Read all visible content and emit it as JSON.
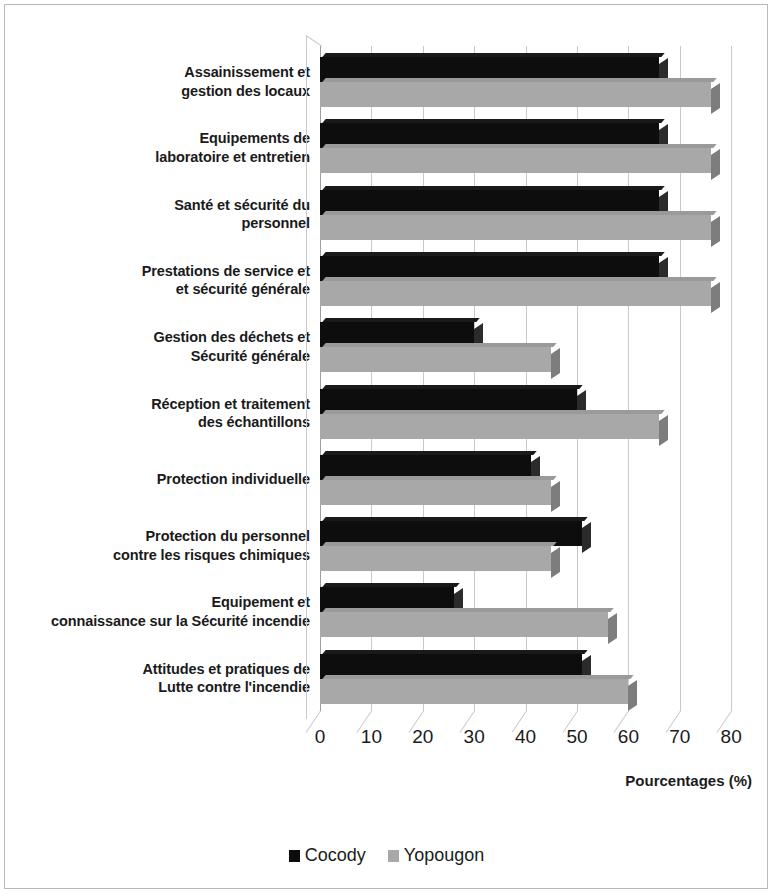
{
  "chart_data": {
    "type": "bar",
    "orientation": "horizontal",
    "title": "",
    "xlabel": "Pourcentages (%)",
    "ylabel": "",
    "xlim": [
      0,
      80
    ],
    "xticks": [
      "0",
      "10",
      "20",
      "30",
      "40",
      "50",
      "60",
      "70",
      "80"
    ],
    "grid": true,
    "legend_position": "bottom",
    "categories": [
      "Assainissement et\ngestion des locaux",
      "Equipements de\nlaboratoire et entretien",
      "Santé et sécurité du\npersonnel",
      "Prestations de service et\net sécurité générale",
      "Gestion des déchets et\nSécurité générale",
      "Réception et traitement\ndes échantillons",
      "Protection individuelle",
      "Protection du personnel\ncontre les risques chimiques",
      "Equipement et\nconnaissance sur la Sécurité incendie",
      "Attitudes et pratiques de\nLutte contre l'incendie"
    ],
    "series": [
      {
        "name": "Cocody",
        "color": "#0d0d0d",
        "values": [
          66,
          66,
          66,
          66,
          30,
          50,
          41,
          51,
          26,
          51
        ]
      },
      {
        "name": "Yopougon",
        "color": "#a8a8a8",
        "values": [
          76,
          76,
          76,
          76,
          45,
          66,
          45,
          45,
          56,
          60
        ]
      }
    ]
  },
  "categories_lines": [
    [
      "Assainissement et",
      "gestion des locaux"
    ],
    [
      "Equipements de",
      "laboratoire et entretien"
    ],
    [
      "Santé et sécurité du",
      "personnel"
    ],
    [
      "Prestations de service et",
      "et sécurité générale"
    ],
    [
      "Gestion des déchets et",
      "Sécurité générale"
    ],
    [
      "Réception et traitement",
      "des échantillons"
    ],
    [
      "Protection individuelle"
    ],
    [
      "Protection du personnel",
      "contre les risques chimiques"
    ],
    [
      "Equipement et",
      "connaissance sur la Sécurité incendie"
    ],
    [
      "Attitudes et pratiques de",
      "Lutte contre l'incendie"
    ]
  ],
  "axis": {
    "x_title": "Pourcentages (%)"
  },
  "legend": {
    "items": [
      {
        "label": "Cocody",
        "color": "#0d0d0d",
        "swatch": "square-marker-dark"
      },
      {
        "label": "Yopougon",
        "color": "#a8a8a8",
        "swatch": "square-marker-gray"
      }
    ]
  }
}
